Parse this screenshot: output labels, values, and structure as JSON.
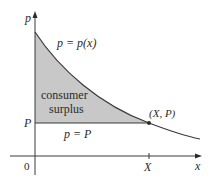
{
  "diagram": {
    "type": "consumer surplus graph",
    "axes": {
      "y_label": "p",
      "x_label": "x",
      "origin_label": "0"
    },
    "labels": {
      "demand_curve": "p = p(x)",
      "price_line": "p = P",
      "price_tick": "P",
      "quantity_tick": "X",
      "equilibrium_point": "(X, P)",
      "region_line1": "consumer",
      "region_line2": "surplus"
    },
    "colors": {
      "shaded_region": "#c8c8c8",
      "curve": "#3a3a3a",
      "axes": "#3a3a3a",
      "background": "#ffffff"
    }
  }
}
